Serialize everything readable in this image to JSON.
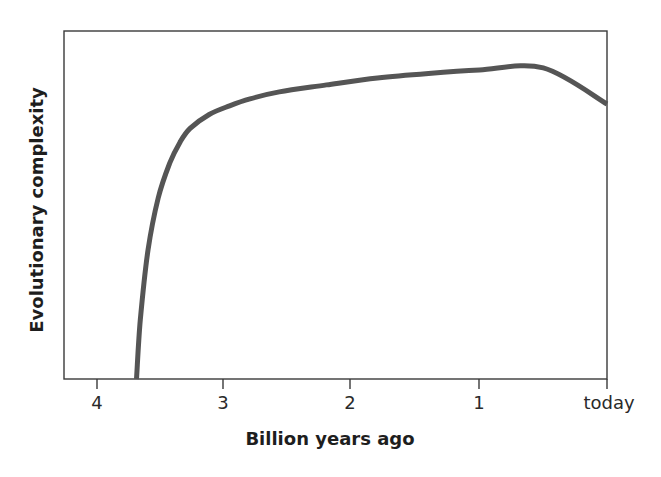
{
  "chart_data": {
    "type": "line",
    "title": "",
    "xlabel": "Billion years ago",
    "ylabel": "Evolutionary complexity",
    "x_ticks": [
      {
        "value": 4,
        "label": "4"
      },
      {
        "value": 3,
        "label": "3"
      },
      {
        "value": 2,
        "label": "2"
      },
      {
        "value": 1,
        "label": "1"
      },
      {
        "value": 0,
        "label": "today"
      }
    ],
    "xlim": [
      4.26,
      0
    ],
    "ylim": [
      0,
      100
    ],
    "y_ticks": [],
    "grid": false,
    "legend": null,
    "series": [
      {
        "name": "Evolutionary complexity",
        "color": "#555555",
        "x": [
          3.69,
          3.66,
          3.6,
          3.52,
          3.43,
          3.35,
          3.27,
          3.12,
          2.96,
          2.8,
          2.57,
          2.2,
          1.8,
          1.4,
          1.0,
          0.5,
          0.0
        ],
        "y": [
          0,
          17,
          37,
          52,
          62,
          68,
          72,
          76,
          78.5,
          80.5,
          82.5,
          84.5,
          86.5,
          87.8,
          88.8,
          89.4,
          79.9
        ]
      }
    ]
  },
  "labels": {
    "xlabel": "Billion years ago",
    "ylabel": "Evolutionary complexity",
    "ticks": [
      "4",
      "3",
      "2",
      "1",
      "today"
    ]
  }
}
